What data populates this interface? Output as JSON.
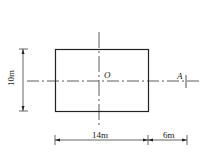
{
  "diagram": {
    "labels": {
      "center": "O",
      "point": "A",
      "height": "10m",
      "width": "14m",
      "offset": "6m"
    },
    "colors": {
      "stroke": "#222222",
      "background": "#ffffff"
    }
  }
}
